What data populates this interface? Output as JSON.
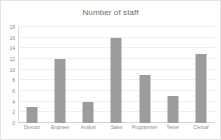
{
  "chart_data": {
    "type": "bar",
    "title": "Number of staff",
    "xlabel": "",
    "ylabel": "",
    "categories": [
      "Director",
      "Engineer",
      "Analyst",
      "Sales",
      "Programmer",
      "Tester",
      "Clerical"
    ],
    "values": [
      3,
      12,
      4,
      16,
      9,
      5,
      13
    ],
    "ylim": [
      0,
      18
    ],
    "ytick_step": 2,
    "yticks": [
      0,
      2,
      4,
      6,
      8,
      10,
      12,
      14,
      16,
      18
    ],
    "ytick_labels": [
      "0",
      "2",
      "4",
      "6",
      "8",
      "10",
      "12",
      "14",
      "16",
      "18"
    ],
    "grid": true,
    "legend": false,
    "series": [
      {
        "name": "Number of staff",
        "values": [
          3,
          12,
          4,
          16,
          9,
          5,
          13
        ]
      }
    ],
    "colors": {
      "bar": "#9c9c9c",
      "grid": "#eeeeee",
      "axis": "#d4d4d4",
      "text": "#8a8a8a",
      "title": "#6d6d6d",
      "background": "#ffffff",
      "border": "#e2e2e2"
    }
  }
}
